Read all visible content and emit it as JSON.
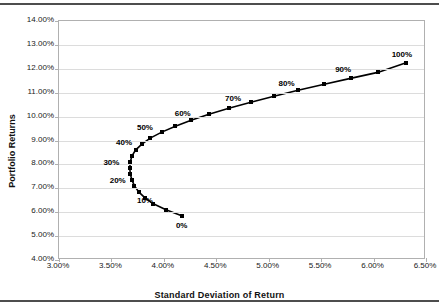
{
  "chart_data": {
    "type": "line",
    "title": "",
    "xlabel": "Standard Deviation of Return",
    "ylabel": "Portfolio Returns",
    "xlim": [
      3.0,
      6.5
    ],
    "ylim": [
      4.0,
      14.0
    ],
    "xticks": [
      "3.00%",
      "3.50%",
      "4.00%",
      "4.50%",
      "5.00%",
      "5.50%",
      "6.00%",
      "6.50%"
    ],
    "xtick_values": [
      3.0,
      3.5,
      4.0,
      4.5,
      5.0,
      5.5,
      6.0,
      6.5
    ],
    "yticks": [
      "4.00%",
      "5.00%",
      "6.00%",
      "7.00%",
      "8.00%",
      "9.00%",
      "10.00%",
      "11.00%",
      "12.00%",
      "13.00%",
      "14.00%"
    ],
    "ytick_values": [
      4,
      5,
      6,
      7,
      8,
      9,
      10,
      11,
      12,
      13,
      14
    ],
    "grid": "horizontal",
    "legend": "none",
    "marker": "square",
    "line_color": "#000000",
    "marker_color": "#000000",
    "gridline_color": "#DCDCDC",
    "axis_color": "#B0B0B0",
    "series": [
      {
        "name": "Efficient Frontier",
        "x": [
          4.17,
          4.02,
          3.9,
          3.82,
          3.76,
          3.72,
          3.695,
          3.68,
          3.675,
          3.68,
          3.695,
          3.73,
          3.79,
          3.87,
          3.98,
          4.11,
          4.26,
          4.43,
          4.62,
          4.83,
          5.05,
          5.28,
          5.53,
          5.78,
          6.04,
          6.31
        ],
        "y": [
          5.85,
          6.1,
          6.35,
          6.6,
          6.85,
          7.1,
          7.35,
          7.6,
          7.85,
          8.1,
          8.35,
          8.6,
          8.85,
          9.1,
          9.35,
          9.6,
          9.85,
          10.1,
          10.35,
          10.6,
          10.85,
          11.1,
          11.35,
          11.6,
          11.85,
          12.25
        ]
      }
    ],
    "point_labels": [
      {
        "text": "0%",
        "x": 4.17,
        "y": 5.45
      },
      {
        "text": "10%",
        "x": 3.82,
        "y": 6.52
      },
      {
        "text": "20%",
        "x": 3.56,
        "y": 7.35
      },
      {
        "text": "30%",
        "x": 3.5,
        "y": 8.08
      },
      {
        "text": "40%",
        "x": 3.62,
        "y": 8.92
      },
      {
        "text": "50%",
        "x": 3.82,
        "y": 9.58
      },
      {
        "text": "60%",
        "x": 4.18,
        "y": 10.14
      },
      {
        "text": "70%",
        "x": 4.66,
        "y": 10.78
      },
      {
        "text": "80%",
        "x": 5.17,
        "y": 11.4
      },
      {
        "text": "90%",
        "x": 5.71,
        "y": 11.98
      },
      {
        "text": "100%",
        "x": 6.27,
        "y": 12.62
      }
    ]
  }
}
